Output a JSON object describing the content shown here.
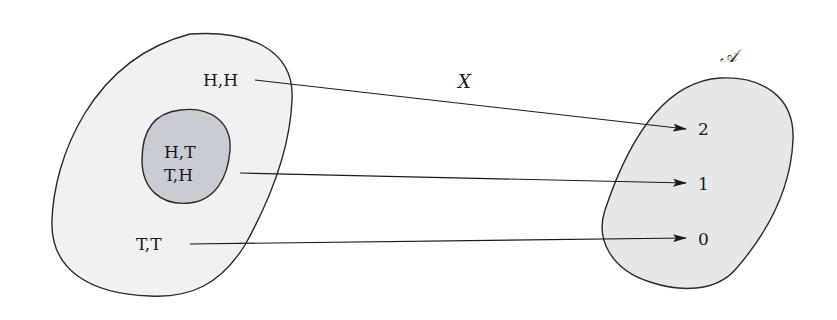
{
  "diagram": {
    "type": "function-mapping",
    "function_label": "X",
    "codomain_label": "𝒜",
    "domain_set": {
      "outcomes": [
        {
          "label": "H,H",
          "maps_to": "2"
        },
        {
          "label_lines": [
            "H,T",
            "T,H"
          ],
          "maps_to": "1",
          "highlighted_subset": true
        },
        {
          "label": "T,T",
          "maps_to": "0"
        }
      ],
      "fill": "#f0f1f2",
      "subset_fill": "#c9ccd3"
    },
    "codomain_set": {
      "values": [
        "2",
        "1",
        "0"
      ],
      "fill": "#e6e7e9"
    },
    "labels": {
      "hh": "H,H",
      "ht": "H,T",
      "th": "T,H",
      "tt": "T,T",
      "v2": "2",
      "v1": "1",
      "v0": "0",
      "x": "X",
      "a": "𝒜"
    }
  }
}
